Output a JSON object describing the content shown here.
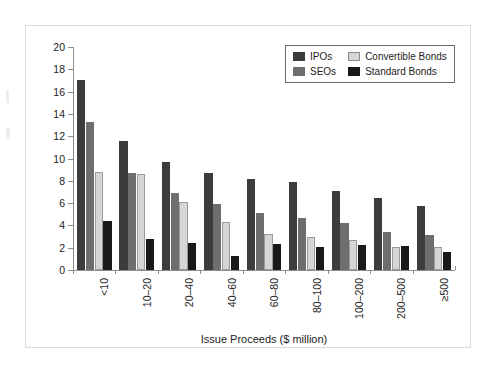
{
  "chart_data": {
    "type": "bar",
    "title": "",
    "xlabel": "Issue Proceeds ($ million)",
    "ylabel": "Total Direct Costs (%)",
    "ylim": [
      0,
      20
    ],
    "ytick_step": 2,
    "yticks": [
      "0",
      "2",
      "4",
      "6",
      "8",
      "10",
      "12",
      "14",
      "16",
      "18",
      "20"
    ],
    "grid": false,
    "legend_position": "top-right",
    "categories": [
      "<10",
      "10–20",
      "20–40",
      "40–60",
      "60–80",
      "80–100",
      "100–200",
      "200–500",
      "≥500"
    ],
    "series": [
      {
        "name": "IPOs",
        "color": "#3c3c3c",
        "values": [
          17.0,
          11.6,
          9.7,
          8.7,
          8.2,
          7.9,
          7.05,
          6.5,
          5.7
        ]
      },
      {
        "name": "SEOs",
        "color": "#6e6e6e",
        "values": [
          13.3,
          8.7,
          6.9,
          5.9,
          5.15,
          4.7,
          4.2,
          3.45,
          3.1
        ]
      },
      {
        "name": "Convertible Bonds",
        "color": "#d6d6d6",
        "values": [
          8.75,
          8.6,
          6.1,
          4.3,
          3.2,
          3.0,
          2.7,
          2.1,
          2.05
        ]
      },
      {
        "name": "Standard Bonds",
        "color": "#191919",
        "values": [
          4.4,
          2.75,
          2.4,
          1.3,
          2.3,
          2.1,
          2.25,
          2.15,
          1.6
        ]
      }
    ]
  }
}
